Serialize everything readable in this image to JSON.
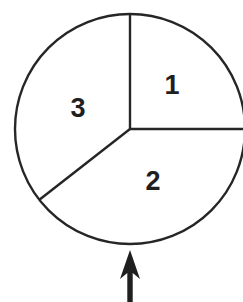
{
  "figure": {
    "type": "spinner-diagram",
    "background_color": "#ffffff",
    "stroke_color": "#262626",
    "label_color": "#1f1f1f",
    "arrow_color": "#1f1f1f",
    "stroke_width": 2.4,
    "canvas": {
      "width": 243,
      "height": 302
    }
  },
  "circle": {
    "name": "spinner-circle",
    "center_x": 130,
    "center_y": 129,
    "radius": 115,
    "fill": "#ffffff"
  },
  "radii": [
    {
      "name": "radius-up",
      "angle_deg": 90,
      "end_x": 130,
      "end_y": 14
    },
    {
      "name": "radius-right",
      "angle_deg": 0,
      "end_x": 245,
      "end_y": 129
    },
    {
      "name": "radius-lower-left",
      "angle_deg": 218,
      "end_x": 39.4,
      "end_y": 199.8
    }
  ],
  "sectors": [
    {
      "name": "sector-1",
      "label": "1",
      "start_angle_deg": 0,
      "end_angle_deg": 90,
      "sweep_deg": 90,
      "label_x": 172,
      "label_y": 85
    },
    {
      "name": "sector-2",
      "label": "2",
      "start_angle_deg": 218,
      "end_angle_deg": 360,
      "sweep_deg": 142,
      "label_x": 153,
      "label_y": 181
    },
    {
      "name": "sector-3",
      "label": "3",
      "start_angle_deg": 90,
      "end_angle_deg": 218,
      "sweep_deg": 128,
      "label_x": 78,
      "label_y": 108
    }
  ],
  "arrow": {
    "name": "pointer-arrow",
    "direction": "up",
    "tip_x": 130,
    "tip_y": 250,
    "head_half_width": 10,
    "head_base_y": 279,
    "shaft_half_width": 2.7,
    "shaft_bottom_y": 302,
    "color": "#1f1f1f"
  },
  "chart_data": {
    "type": "pie",
    "categories": [
      "1",
      "2",
      "3"
    ],
    "values": [
      90,
      142,
      128
    ],
    "value_unit": "degrees",
    "fractions": [
      0.25,
      0.3944,
      0.3556
    ],
    "labels_inside": true,
    "legend": "none",
    "grid": false,
    "annotations": [
      {
        "name": "pointer-arrow",
        "text": "",
        "points_to": "bottom of spinner",
        "direction": "up"
      }
    ]
  }
}
